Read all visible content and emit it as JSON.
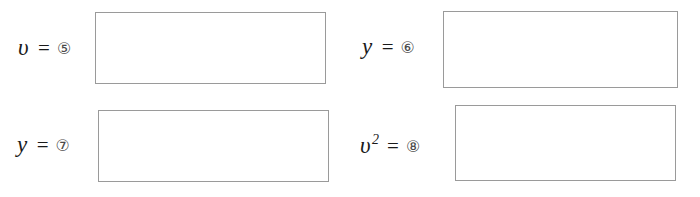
{
  "worksheet": {
    "background_color": "#ffffff",
    "box_border_color": "#9a9a9a",
    "text_color": "#1a1a1a",
    "marker_color": "#4a4a4a",
    "fields": [
      {
        "id": "field-1",
        "variable": "υ",
        "exponent": "",
        "equals": "=",
        "marker": "⑤",
        "marker_number": "5",
        "answer_value": ""
      },
      {
        "id": "field-2",
        "variable": "y",
        "exponent": "",
        "equals": "=",
        "marker": "⑥",
        "marker_number": "6",
        "answer_value": ""
      },
      {
        "id": "field-3",
        "variable": "y",
        "exponent": "",
        "equals": "=",
        "marker": "⑦",
        "marker_number": "7",
        "answer_value": ""
      },
      {
        "id": "field-4",
        "variable": "υ",
        "exponent": "2",
        "equals": "=",
        "marker": "⑧",
        "marker_number": "8",
        "answer_value": ""
      }
    ]
  }
}
